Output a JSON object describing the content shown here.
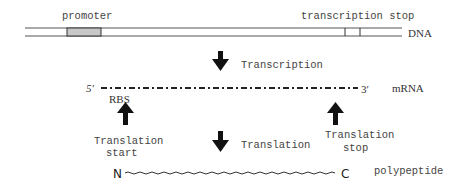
{
  "dna": {
    "label": "DNA",
    "promoter_label": "promoter",
    "stop_label": "transcription stop"
  },
  "transcription": {
    "label": "Transcription"
  },
  "mrna": {
    "label": "mRNA",
    "five_prime": "5′",
    "three_prime": "3′",
    "rbs_label": "RBS"
  },
  "translation": {
    "label": "Translation",
    "start_label_line1": "Translation",
    "start_label_line2": "start",
    "stop_label_line1": "Translation",
    "stop_label_line2": "stop"
  },
  "polypeptide": {
    "label": "polypeptide",
    "n_term": "N",
    "c_term": "C"
  },
  "colors": {
    "line": "#555555",
    "promoter_fill": "#c8c8c8",
    "arrow": "#111111"
  }
}
